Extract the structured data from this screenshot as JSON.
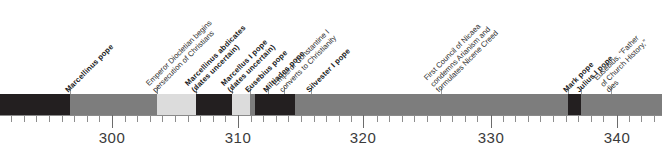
{
  "axis": {
    "unit_label": "year",
    "major_ticks": [
      {
        "value": 300,
        "label": "300",
        "x": 112
      },
      {
        "value": 310,
        "label": "310",
        "x": 238
      },
      {
        "value": 320,
        "label": "320",
        "x": 363
      },
      {
        "value": 330,
        "label": "330",
        "x": 491
      },
      {
        "value": 340,
        "label": "340",
        "x": 617
      }
    ],
    "minor_tick_spacing_px": 12.6,
    "px_per_year": 12.58,
    "year_at_x0": 291.1,
    "range": [
      291,
      345
    ]
  },
  "colors": {
    "dark": "#231f20",
    "medium": "#7d7d7d",
    "light": "#dcdcdc",
    "background": "#ffffff",
    "axis": "#8a8a8a",
    "text": "#1a1a1a"
  },
  "bar": {
    "top": 94,
    "height": 21,
    "segments": [
      {
        "name": "segment-1",
        "x": 0,
        "w": 70,
        "shade": "dark"
      },
      {
        "name": "segment-2",
        "x": 70,
        "w": 87,
        "shade": "medium"
      },
      {
        "name": "segment-3",
        "x": 157,
        "w": 39,
        "shade": "light"
      },
      {
        "name": "segment-4",
        "x": 196,
        "w": 36,
        "shade": "dark"
      },
      {
        "name": "segment-5",
        "x": 232,
        "w": 18,
        "shade": "light"
      },
      {
        "name": "segment-6",
        "x": 250,
        "w": 5,
        "shade": "medium"
      },
      {
        "name": "segment-7",
        "x": 255,
        "w": 40,
        "shade": "dark"
      },
      {
        "name": "segment-8",
        "x": 295,
        "w": 273,
        "shade": "medium"
      },
      {
        "name": "segment-9",
        "x": 568,
        "w": 13,
        "shade": "dark"
      },
      {
        "name": "segment-10",
        "x": 581,
        "w": 81,
        "shade": "medium"
      }
    ]
  },
  "labels": [
    {
      "name": "label-marcellinus-pope",
      "kind": "pope",
      "anchor_x": 70,
      "lines": [
        "Marcellinus pope"
      ]
    },
    {
      "name": "label-diocletian-persecution",
      "kind": "event",
      "anchor_x": 157,
      "lines": [
        "Emperor Diocletian begins",
        "persecution of Christians"
      ]
    },
    {
      "name": "label-marcellinus-abdicates",
      "kind": "pope",
      "anchor_x": 196,
      "lines": [
        "Marcellinus abdicates",
        "(dates uncertain)"
      ]
    },
    {
      "name": "label-marcellus-i-pope",
      "kind": "pope",
      "anchor_x": 232,
      "lines": [
        "Marcellus I pope",
        "(dates uncertain)"
      ]
    },
    {
      "name": "label-eusebius-pope",
      "kind": "pope",
      "anchor_x": 250,
      "lines": [
        "Eusebius pope"
      ]
    },
    {
      "name": "label-miltiades-pope",
      "kind": "pope",
      "anchor_x": 268,
      "lines": [
        "Miltiades pope"
      ]
    },
    {
      "name": "label-constantine-converts",
      "kind": "event",
      "anchor_x": 284,
      "lines": [
        "Emperor Constantine I",
        "converts to Christianity"
      ]
    },
    {
      "name": "label-silvester-i-pope",
      "kind": "pope",
      "anchor_x": 311,
      "lines": [
        "Silvester I pope"
      ]
    },
    {
      "name": "label-council-of-nicaea",
      "kind": "event",
      "anchor_x": 441,
      "lines": [
        "First Council of Nicaea",
        "condemns Arianism and",
        "formulates Nicene Creed"
      ]
    },
    {
      "name": "label-mark-pope",
      "kind": "pope",
      "anchor_x": 568,
      "lines": [
        "Mark pope"
      ]
    },
    {
      "name": "label-julius-i-pope",
      "kind": "pope",
      "anchor_x": 581,
      "lines": [
        "Julius I pope"
      ]
    },
    {
      "name": "label-eusebius-dies",
      "kind": "event",
      "anchor_x": 611,
      "lines": [
        "Eusebius, “Father",
        "of Church History,”",
        "dies"
      ]
    }
  ]
}
